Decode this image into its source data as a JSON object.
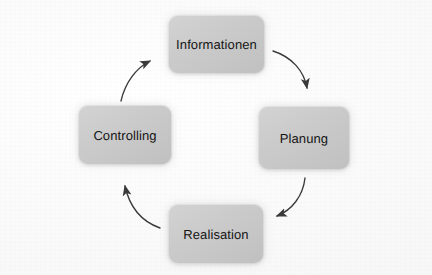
{
  "diagram": {
    "type": "cycle",
    "direction": "clockwise",
    "background_color": "#fbfbfb",
    "node_fill_color": "#cacaca",
    "node_text_color": "#141414",
    "arrow_color": "#3a3a3a",
    "nodes": [
      {
        "id": "informationen",
        "label": "Informationen",
        "position": "top"
      },
      {
        "id": "planung",
        "label": "Planung",
        "position": "right"
      },
      {
        "id": "realisation",
        "label": "Realisation",
        "position": "bottom"
      },
      {
        "id": "controlling",
        "label": "Controlling",
        "position": "left"
      }
    ],
    "arrows": [
      {
        "id": "arrow-informationen-planung",
        "from": "informationen",
        "to": "planung",
        "icon": "curved-arrow-icon",
        "quadrant": "top-right"
      },
      {
        "id": "arrow-planung-realisation",
        "from": "planung",
        "to": "realisation",
        "icon": "curved-arrow-icon",
        "quadrant": "bottom-right"
      },
      {
        "id": "arrow-realisation-controlling",
        "from": "realisation",
        "to": "controlling",
        "icon": "curved-arrow-icon",
        "quadrant": "bottom-left"
      },
      {
        "id": "arrow-controlling-informationen",
        "from": "controlling",
        "to": "informationen",
        "icon": "curved-arrow-icon",
        "quadrant": "top-left"
      }
    ]
  }
}
